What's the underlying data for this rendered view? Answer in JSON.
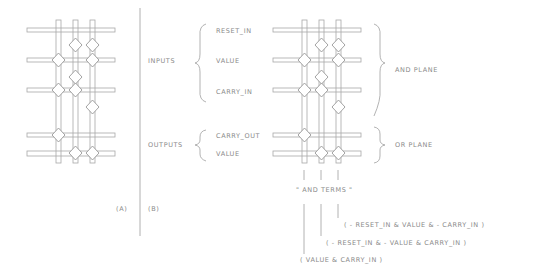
{
  "diagram": {
    "panel_a": {
      "label": "(A)"
    },
    "panel_b": {
      "label": "(B)",
      "group_labels": {
        "inputs": "Inputs",
        "outputs": "Outputs"
      },
      "inputs": [
        "Reset_In",
        "Value",
        "Carry_In"
      ],
      "outputs": [
        "Carry_Out",
        "Value"
      ],
      "plane_labels": {
        "and_plane": "AND Plane",
        "or_plane": "OR Plane"
      },
      "and_terms_label": "\" AND Terms \"",
      "terms": [
        "( - Reset_In  &  Value  &  - Carry_In )",
        "( - Reset_In  &  - Value  &  Carry_In )",
        "( Value  &  Carry_In )"
      ]
    },
    "colors": {
      "line": "#9a9a9a",
      "text": "#8a8a8a",
      "background": "#ffffff"
    }
  }
}
